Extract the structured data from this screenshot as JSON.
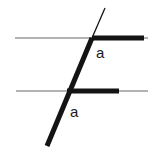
{
  "figure": {
    "background_color": "#ffffff",
    "width": 163,
    "height": 160,
    "colors": {
      "parallel_line": "#9a9a9a",
      "highlight": "#141414",
      "transversal": "#141414",
      "label_text": "#1a1a1a"
    },
    "parallel_lines": [
      {
        "name": "upper-parallel-line",
        "x1": 15,
        "y1": 38,
        "x2": 148,
        "y2": 38,
        "stroke_width": 1.4
      },
      {
        "name": "lower-parallel-line",
        "x1": 16,
        "y1": 91,
        "x2": 148,
        "y2": 91,
        "stroke_width": 1.4
      }
    ],
    "highlight_rays": [
      {
        "name": "upper-angle-ray",
        "x1": 92,
        "y1": 38,
        "x2": 144,
        "y2": 38,
        "stroke_width": 5
      },
      {
        "name": "lower-angle-ray",
        "x1": 67,
        "y1": 91,
        "x2": 119,
        "y2": 91,
        "stroke_width": 5
      }
    ],
    "transversal": {
      "name": "transversal-line",
      "thin_segment": {
        "x1": 105,
        "y1": 8,
        "x2": 92,
        "y2": 38,
        "stroke_width": 1.3
      },
      "thick_segment": {
        "x1": 92,
        "y1": 38,
        "x2": 47,
        "y2": 146,
        "stroke_width": 5
      }
    },
    "intersections": [
      {
        "name": "upper-intersection",
        "x": 92,
        "y": 38
      },
      {
        "name": "lower-intersection",
        "x": 67,
        "y": 91
      }
    ],
    "labels": [
      {
        "name": "upper-angle-label",
        "text": "a",
        "x": 96,
        "y": 58
      },
      {
        "name": "lower-angle-label",
        "text": "a",
        "x": 70,
        "y": 117
      }
    ]
  }
}
